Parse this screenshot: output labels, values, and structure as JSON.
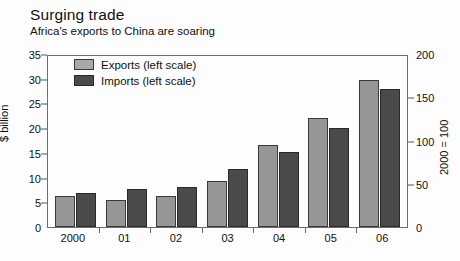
{
  "header": {
    "title": "Surging trade",
    "subtitle": "Africa's exports to China are soaring"
  },
  "legend": {
    "items": [
      {
        "label": "Exports (left scale)",
        "key": "exports",
        "color": "#a8a8a8"
      },
      {
        "label": "Imports (left scale)",
        "key": "imports",
        "color": "#4a4a4a"
      }
    ]
  },
  "chart_data": {
    "type": "bar",
    "title": "Surging trade",
    "subtitle": "Africa's exports to China are soaring",
    "xlabel": "",
    "ylabel": "$ billion",
    "ylabel_right": "2000 = 100",
    "categories": [
      "2000",
      "01",
      "02",
      "03",
      "04",
      "05",
      "06"
    ],
    "series": [
      {
        "name": "Exports (left scale)",
        "color": "#969696",
        "values": [
          6.3,
          5.4,
          6.2,
          9.4,
          16.5,
          22.0,
          29.8
        ]
      },
      {
        "name": "Imports (left scale)",
        "color": "#4a4a4a",
        "values": [
          6.8,
          7.6,
          8.1,
          11.7,
          15.2,
          20.0,
          28.0
        ]
      }
    ],
    "ylim": [
      0,
      35
    ],
    "yticks": [
      0,
      5,
      10,
      15,
      20,
      25,
      30,
      35
    ],
    "ylim_right": [
      0,
      200
    ],
    "yticks_right": [
      0,
      50,
      100,
      150,
      200
    ],
    "grid": false,
    "legend_position": "top-left"
  }
}
